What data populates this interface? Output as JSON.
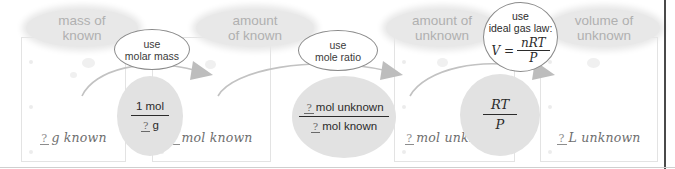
{
  "diagram": {
    "blank_symbol": "?",
    "colors": {
      "pill_fill": "#e8e8e8",
      "pill_text": "#b0b0b0",
      "disc_fill": "#e2e2e2",
      "arrow": "#b9b9b9",
      "card_border": "#e3e3e3",
      "frame": "#4a4a4a"
    },
    "stages": [
      {
        "id": "mass-of-known",
        "pill_line1": "mass of",
        "pill_line2": "known",
        "hand_unit": "g known"
      },
      {
        "id": "amount-of-known",
        "pill_line1": "amount",
        "pill_line2": "of known",
        "hand_unit": "mol known"
      },
      {
        "id": "amount-of-unknown",
        "pill_line1": "amount of",
        "pill_line2": "unknown",
        "hand_unit": "mol unknown"
      },
      {
        "id": "volume-of-unknown",
        "pill_line1": "volume of",
        "pill_line2": "unknown",
        "hand_unit": "L unknown"
      }
    ],
    "operations": [
      {
        "id": "molar-mass",
        "line1": "use",
        "line2": "molar mass",
        "factor_numerator": "1 mol",
        "factor_denominator_unit": "g"
      },
      {
        "id": "mole-ratio",
        "line1": "use",
        "line2": "mole ratio",
        "factor_numerator_unit": "mol unknown",
        "factor_denominator_unit": "mol known"
      },
      {
        "id": "ideal-gas-law",
        "line1": "use",
        "line2": "ideal gas law:",
        "equation_lhs": "V =",
        "equation_numerator": "nRT",
        "equation_denominator": "P",
        "factor_numerator": "RT",
        "factor_denominator": "P"
      }
    ]
  }
}
